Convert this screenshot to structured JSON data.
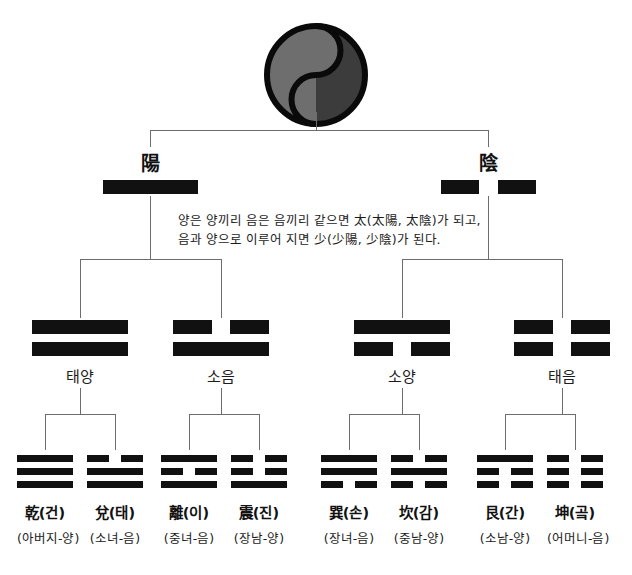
{
  "diagram": {
    "title_symbol": "taegeuk-symbol",
    "colors": {
      "yang_half": "#6e6e6e",
      "yin_half": "#3c3c3c",
      "outline": "#0a0a0a",
      "line_stroke": "#6d6d6d",
      "yao_fill": "#111111"
    }
  },
  "level1": {
    "items": [
      {
        "label": "陽",
        "lines": [
          "solid"
        ],
        "name": "yang"
      },
      {
        "label": "陰",
        "lines": [
          "broken"
        ],
        "name": "yin"
      }
    ]
  },
  "note": {
    "line1": "양은 양끼리 음은 음끼리 같으면 太(太陽, 太陰)가 되고,",
    "line2": "음과 양으로 이루어 지면 少(少陽, 少陰)가 된다."
  },
  "level2": {
    "items": [
      {
        "label": "태양",
        "lines": [
          "solid",
          "solid"
        ],
        "name": "taeyang"
      },
      {
        "label": "소음",
        "lines": [
          "broken",
          "solid"
        ],
        "name": "soeum"
      },
      {
        "label": "소양",
        "lines": [
          "solid",
          "broken"
        ],
        "name": "soyang"
      },
      {
        "label": "태음",
        "lines": [
          "broken",
          "broken"
        ],
        "name": "taeeum"
      }
    ]
  },
  "level3": {
    "items": [
      {
        "name": "乾(건)",
        "sub": "(아버지-양)",
        "lines": [
          "solid",
          "solid",
          "solid"
        ],
        "key": "geon"
      },
      {
        "name": "兌(태)",
        "sub": "(소녀-음)",
        "lines": [
          "broken",
          "solid",
          "solid"
        ],
        "key": "tae"
      },
      {
        "name": "離(이)",
        "sub": "(중녀-음)",
        "lines": [
          "solid",
          "broken",
          "solid"
        ],
        "key": "i"
      },
      {
        "name": "震(진)",
        "sub": "(장남-양)",
        "lines": [
          "broken",
          "broken",
          "solid"
        ],
        "key": "jin"
      },
      {
        "name": "巽(손)",
        "sub": "(장녀-음)",
        "lines": [
          "solid",
          "solid",
          "broken"
        ],
        "key": "son"
      },
      {
        "name": "坎(감)",
        "sub": "(중남-양)",
        "lines": [
          "broken",
          "solid",
          "broken"
        ],
        "key": "gam"
      },
      {
        "name": "艮(간)",
        "sub": "(소남-양)",
        "lines": [
          "solid",
          "broken",
          "broken"
        ],
        "key": "gan"
      },
      {
        "name": "坤(곸)",
        "sub": "(어머니-음)",
        "lines": [
          "broken",
          "broken",
          "broken"
        ],
        "key": "gon"
      }
    ]
  }
}
